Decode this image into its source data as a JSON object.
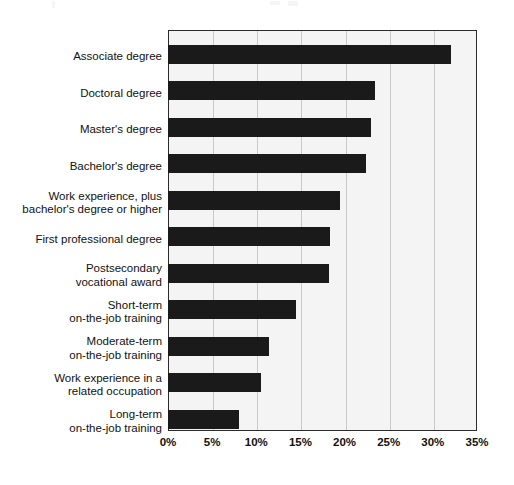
{
  "chart_data": {
    "type": "bar",
    "orientation": "horizontal",
    "title": "",
    "subtitle": "",
    "xlabel": "",
    "ylabel": "",
    "xlim": [
      0,
      35
    ],
    "grid": true,
    "legend": null,
    "bar_color": "#1a1a1a",
    "plot_background": "#f4f4f4",
    "gridline_color": "#c9c9c9",
    "axis_color": "#2b2b2b",
    "xticks": [
      0,
      5,
      10,
      15,
      20,
      25,
      30,
      35
    ],
    "xtick_labels": [
      "0%",
      "5%",
      "10%",
      "15%",
      "20%",
      "25%",
      "30%",
      "35%"
    ],
    "categories": [
      "Associate degree",
      "Doctoral degree",
      "Master's degree",
      "Bachelor's degree",
      "Work experience, plus\nbachelor's degree or higher",
      "First professional degree",
      "Postsecondary\nvocational award",
      "Short-term\non-the-job training",
      "Moderate-term\non-the-job training",
      "Work experience in a\nrelated occupation",
      "Long-term\non-the-job training"
    ],
    "values": [
      32.0,
      23.5,
      23.0,
      22.4,
      19.5,
      18.4,
      18.2,
      14.5,
      11.4,
      10.5,
      8.0
    ],
    "value_labels": [
      "32.0%",
      "23.5%",
      "23.0%",
      "22.4%",
      "19.5%",
      "18.4%",
      "18.2%",
      "14.5%",
      "11.4%",
      "10.5%",
      "8.0%"
    ]
  }
}
